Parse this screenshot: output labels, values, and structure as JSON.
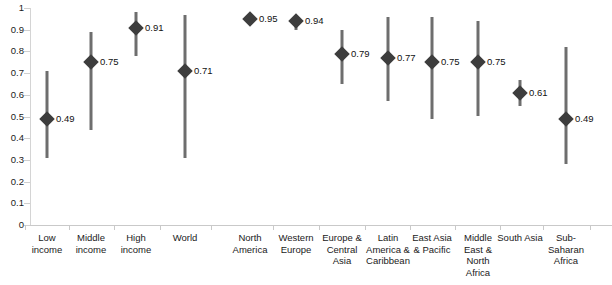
{
  "chart_data": {
    "type": "scatter",
    "title": "",
    "subtitle": "",
    "xlabel": "",
    "ylabel": "",
    "ylim": [
      0,
      1
    ],
    "grid": false,
    "legend": null,
    "axis": {
      "y_ticks": [
        "0",
        "0.1",
        "0.2",
        "0.3",
        "0.4",
        "0.5",
        "0.6",
        "0.7",
        "0.8",
        "0.9",
        "1"
      ],
      "y_tick_values": [
        0,
        0.1,
        0.2,
        0.3,
        0.4,
        0.5,
        0.6,
        0.7,
        0.8,
        0.9,
        1
      ]
    },
    "marker_style": "diamond",
    "marker_color": "#3d3d3d",
    "range_color": "#6e6e6e",
    "categories": [
      "Low income",
      "Middle income",
      "High income",
      "World",
      "North America",
      "Western Europe",
      "Europe & Central Asia",
      "Latin America & Caribbean",
      "East Asia & Pacific",
      "Middle East & North Africa",
      "South Asia",
      "Sub-Saharan Africa"
    ],
    "values": [
      0.49,
      0.75,
      0.91,
      0.71,
      0.95,
      0.94,
      0.79,
      0.77,
      0.75,
      0.75,
      0.61,
      0.49
    ],
    "value_labels": [
      "0.49",
      "0.75",
      "0.91",
      "0.71",
      "0.95",
      "0.94",
      "0.79",
      "0.77",
      "0.75",
      "0.75",
      "0.61",
      "0.49"
    ],
    "range_low": [
      0.31,
      0.44,
      0.78,
      0.31,
      0.95,
      0.9,
      0.65,
      0.57,
      0.49,
      0.5,
      0.55,
      0.28
    ],
    "range_high": [
      0.71,
      0.89,
      0.98,
      0.97,
      0.95,
      0.96,
      0.9,
      0.96,
      0.96,
      0.94,
      0.67,
      0.82
    ],
    "points": [
      {
        "category": "Low income",
        "value": 0.49,
        "label": "0.49",
        "low": 0.31,
        "high": 0.71,
        "group": "income"
      },
      {
        "category": "Middle income",
        "value": 0.75,
        "label": "0.75",
        "low": 0.44,
        "high": 0.89,
        "group": "income"
      },
      {
        "category": "High income",
        "value": 0.91,
        "label": "0.91",
        "low": 0.78,
        "high": 0.98,
        "group": "income"
      },
      {
        "category": "World",
        "value": 0.71,
        "label": "0.71",
        "low": 0.31,
        "high": 0.97,
        "group": "income"
      },
      {
        "category": "North America",
        "value": 0.95,
        "label": "0.95",
        "low": 0.95,
        "high": 0.95,
        "group": "region"
      },
      {
        "category": "Western Europe",
        "value": 0.94,
        "label": "0.94",
        "low": 0.9,
        "high": 0.96,
        "group": "region"
      },
      {
        "category": "Europe & Central Asia",
        "value": 0.79,
        "label": "0.79",
        "low": 0.65,
        "high": 0.9,
        "group": "region"
      },
      {
        "category": "Latin America & Caribbean",
        "value": 0.77,
        "label": "0.77",
        "low": 0.57,
        "high": 0.96,
        "group": "region"
      },
      {
        "category": "East Asia & Pacific",
        "value": 0.75,
        "label": "0.75",
        "low": 0.49,
        "high": 0.96,
        "group": "region"
      },
      {
        "category": "Middle East & North Africa",
        "value": 0.75,
        "label": "0.75",
        "low": 0.5,
        "high": 0.94,
        "group": "region"
      },
      {
        "category": "South Asia",
        "value": 0.61,
        "label": "0.61",
        "low": 0.55,
        "high": 0.67,
        "group": "region"
      },
      {
        "category": "Sub-Saharan Africa",
        "value": 0.49,
        "label": "0.49",
        "low": 0.28,
        "high": 0.82,
        "group": "region"
      }
    ],
    "category_label_lines": [
      [
        "Low",
        "income"
      ],
      [
        "Middle",
        "income"
      ],
      [
        "High",
        "income"
      ],
      [
        "World"
      ],
      [
        "North",
        "America"
      ],
      [
        "Western",
        "Europe"
      ],
      [
        "Europe &",
        "Central",
        "Asia"
      ],
      [
        "Latin",
        "America &",
        "Caribbean"
      ],
      [
        "East Asia",
        "& Pacific"
      ],
      [
        "Middle",
        "East &",
        "North",
        "Africa"
      ],
      [
        "South Asia"
      ],
      [
        "Sub-",
        "Saharan",
        "Africa"
      ]
    ]
  }
}
